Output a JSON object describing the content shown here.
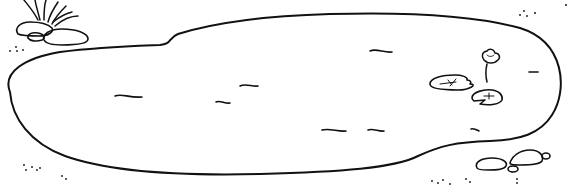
{
  "scene": {
    "title": "Pond line drawing",
    "background": "#ffffff",
    "stroke": "#111111",
    "elements": {
      "pond": "pond-outline",
      "grass": "grass-tuft",
      "rocks_top_left": 3,
      "rocks_bottom_right": 3,
      "lily_pads": 2,
      "lotus_flower": 1,
      "water_ripples": 10,
      "pebble_dot_clusters": 6
    }
  }
}
